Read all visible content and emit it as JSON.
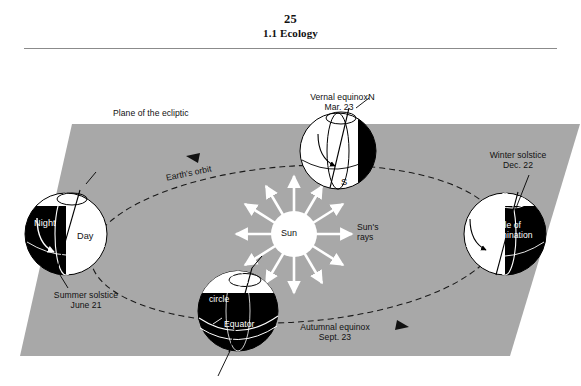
{
  "header": {
    "page_number": "25",
    "section_title": "1.1 Ecology"
  },
  "figure": {
    "plane_label": "Plane of the ecliptic",
    "orbit_label": "Earth's orbit",
    "sun_label": "Sun",
    "sun_rays_label": "Sun's\nrays",
    "sun_rays_line1": "Sun's",
    "sun_rays_line2": "rays",
    "positions": [
      {
        "id": "vernal-equinox",
        "name_line1": "Vernal equinox",
        "name_line2": "Mar. 23",
        "pole_north": "N",
        "pole_south": "S"
      },
      {
        "id": "winter-solstice",
        "name_line1": "Winter solstice",
        "name_line2": "Dec. 22",
        "annotation_line1": "Circle of",
        "annotation_line2": "illumination"
      },
      {
        "id": "autumnal-equinox",
        "name_line1": "Autumnal equinox",
        "name_line2": "Sept. 23",
        "annotation_line1": "Arctic",
        "annotation_line2": "circle",
        "annotation_line3": "Equator"
      },
      {
        "id": "summer-solstice",
        "name_line1": "Summer solstice",
        "name_line2": "June 21",
        "annotation_night": "Night",
        "annotation_day": "Day"
      }
    ],
    "colors": {
      "plane_gray": "#a8a8a8",
      "night_black": "#000000",
      "day_white": "#ffffff",
      "rays_white": "#ffffff",
      "text_black": "#111111",
      "rule_gray": "#8b8b8b"
    }
  }
}
